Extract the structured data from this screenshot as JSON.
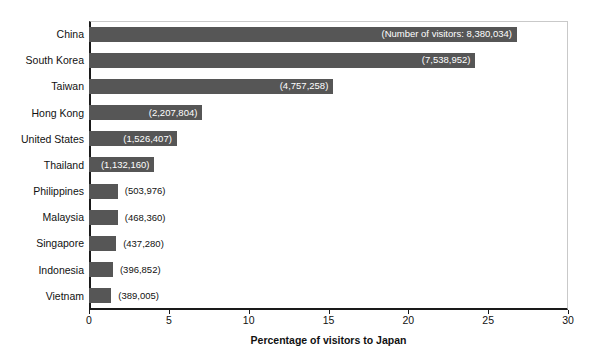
{
  "chart_data": {
    "type": "bar",
    "orientation": "horizontal",
    "title": "",
    "xlabel": "Percentage of visitors to Japan",
    "ylabel": "",
    "xlim": [
      0,
      30
    ],
    "xticks": [
      0,
      5,
      10,
      15,
      20,
      25,
      30
    ],
    "xtick_labels": [
      "0",
      "5",
      "10",
      "15",
      "20",
      "25",
      "30"
    ],
    "grid": false,
    "legend": "none",
    "bar_color": "#565656",
    "categories": [
      "China",
      "South Korea",
      "Taiwan",
      "Hong Kong",
      "United States",
      "Thailand",
      "Philippines",
      "Malaysia",
      "Singapore",
      "Indonesia",
      "Vietnam"
    ],
    "values": [
      26.8,
      24.2,
      15.3,
      7.1,
      5.5,
      4.1,
      1.8,
      1.8,
      1.7,
      1.5,
      1.4
    ],
    "data_labels": [
      "(Number of visitors: 8,380,034)",
      "(7,538,952)",
      "(4,757,258)",
      "(2,207,804)",
      "(1,526,407)",
      "(1,132,160)",
      "(503,976)",
      "(468,360)",
      "(437,280)",
      "(396,852)",
      "(389,005)"
    ],
    "label_placement": [
      "inside",
      "inside",
      "inside",
      "inside",
      "inside",
      "inside",
      "outside",
      "outside",
      "outside",
      "outside",
      "outside"
    ],
    "visitor_counts": [
      8380034,
      7538952,
      4757258,
      2207804,
      1526407,
      1132160,
      503976,
      468360,
      437280,
      396852,
      389005
    ]
  }
}
